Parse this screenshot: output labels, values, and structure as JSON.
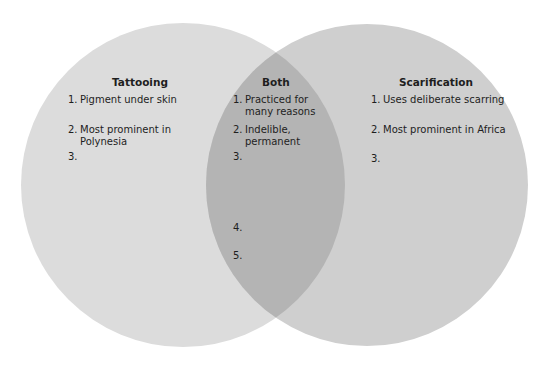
{
  "colors": {
    "left": "#dcdcdc",
    "right": "#cfcfcf",
    "overlap": "#b4b4b4",
    "text": "#1e1e1e"
  },
  "left": {
    "title": "Tattooing",
    "items": [
      {
        "num": "1.",
        "line1": "Pigment under skin",
        "line2": ""
      },
      {
        "num": "2.",
        "line1": "Most prominent in",
        "line2": "Polynesia"
      },
      {
        "num": "3.",
        "line1": "",
        "line2": ""
      }
    ]
  },
  "both": {
    "title": "Both",
    "items": [
      {
        "num": "1.",
        "line1": "Practiced for",
        "line2": "many reasons"
      },
      {
        "num": "2.",
        "line1": "Indelible,",
        "line2": "permanent"
      },
      {
        "num": "3.",
        "line1": "",
        "line2": ""
      },
      {
        "num": "4.",
        "line1": "",
        "line2": ""
      },
      {
        "num": "5.",
        "line1": "",
        "line2": ""
      }
    ]
  },
  "right": {
    "title": "Scarification",
    "items": [
      {
        "num": "1.",
        "line1": "Uses deliberate scarring",
        "line2": ""
      },
      {
        "num": "2.",
        "line1": "Most prominent in Africa",
        "line2": ""
      },
      {
        "num": "3.",
        "line1": "",
        "line2": ""
      }
    ]
  }
}
